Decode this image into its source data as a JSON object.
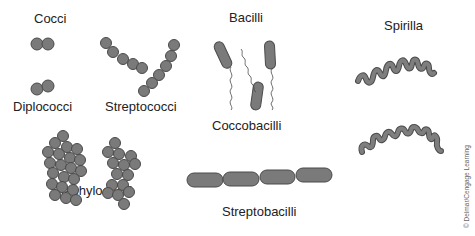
{
  "labels": {
    "cocci": "Cocci",
    "diplococci": "Diplococci",
    "streptococci": "Streptococci",
    "staphylococci": "Staphylococci",
    "bacilli": "Bacilli",
    "coccobacilli": "Coccobacilli",
    "streptobacilli": "Streptobacilli",
    "spirilla": "Spirilla"
  },
  "credit": "© Delmar/Cengage Learning",
  "colors": {
    "cell_fill": "#7a7a7a",
    "cell_stroke": "#4a4a4a",
    "text": "#222222"
  }
}
